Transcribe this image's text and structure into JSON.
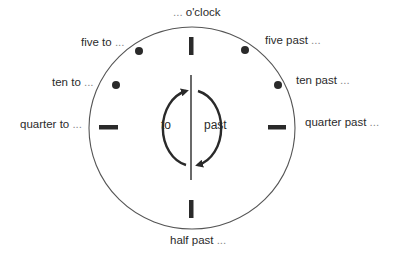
{
  "diagram": {
    "colors": {
      "ink": "#2a2a2a",
      "circle": "#555555",
      "background": "#ffffff"
    },
    "labels": {
      "top": {
        "text": "o'clock",
        "prefix": "... "
      },
      "five_to": {
        "text": "five to",
        "suffix": " ..."
      },
      "ten_to": {
        "text": "ten to",
        "suffix": " ..."
      },
      "quarter_to": {
        "text": "quarter to",
        "suffix": " ..."
      },
      "five_past": {
        "text": "five past",
        "suffix": " ..."
      },
      "ten_past": {
        "text": "ten past",
        "suffix": " ..."
      },
      "quarter_past": {
        "text": "quarter past",
        "suffix": " ..."
      },
      "half_past": {
        "text": "half past",
        "suffix": " ..."
      }
    },
    "inner": {
      "left_label": "to",
      "right_label": "past"
    },
    "marks": [
      {
        "position": "12",
        "type": "bar"
      },
      {
        "position": "1",
        "type": "dot"
      },
      {
        "position": "2",
        "type": "dot"
      },
      {
        "position": "3",
        "type": "bar"
      },
      {
        "position": "6",
        "type": "bar"
      },
      {
        "position": "9",
        "type": "bar"
      },
      {
        "position": "10",
        "type": "dot"
      },
      {
        "position": "11",
        "type": "dot"
      }
    ]
  }
}
